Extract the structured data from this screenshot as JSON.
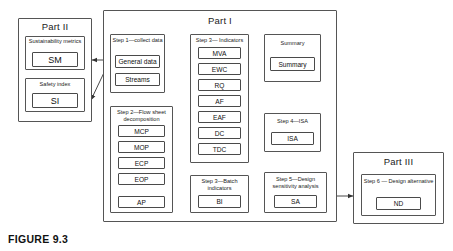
{
  "figure": {
    "caption": "FIGURE 9.3"
  },
  "parts": {
    "part1": {
      "title": "Part I"
    },
    "part2": {
      "title": "Part II"
    },
    "part3": {
      "title": "Part III"
    }
  },
  "groups": {
    "sustainability_metrics": {
      "title": "Sustainability metrics",
      "items": [
        {
          "label": "SM"
        }
      ]
    },
    "safety_index": {
      "title": "Safety index",
      "items": [
        {
          "label": "SI"
        }
      ]
    },
    "step1": {
      "title": "Step 1—collect data",
      "items": [
        {
          "label": "General data"
        },
        {
          "label": "Streams"
        }
      ]
    },
    "step2": {
      "title": "Step 2—Flow sheet decomposition",
      "items": [
        {
          "label": "MCP"
        },
        {
          "label": "MOP"
        },
        {
          "label": "ECP"
        },
        {
          "label": "EOP"
        },
        {
          "label": "AP"
        }
      ]
    },
    "step3_indicators": {
      "title": "Step 3— Indicators",
      "items": [
        {
          "label": "MVA"
        },
        {
          "label": "EWC"
        },
        {
          "label": "RQ"
        },
        {
          "label": "AF"
        },
        {
          "label": "EAF"
        },
        {
          "label": "DC"
        },
        {
          "label": "TDC"
        }
      ]
    },
    "step3_batch": {
      "title": "Step 3—Batch indicators",
      "items": [
        {
          "label": "BI"
        }
      ]
    },
    "summary": {
      "title": "Summary",
      "items": [
        {
          "label": "Summary"
        }
      ]
    },
    "step4": {
      "title": "Step 4—ISA",
      "items": [
        {
          "label": "ISA"
        }
      ]
    },
    "step5": {
      "title": "Step 5—Design sensitivity analysis",
      "items": [
        {
          "label": "SA"
        }
      ]
    },
    "step6": {
      "title": "Step 6 — Design alternative",
      "items": [
        {
          "label": "ND"
        }
      ]
    }
  },
  "style": {
    "line_color": "#4a4a4a",
    "background": "#ffffff",
    "text_color": "#1a1a1a"
  }
}
